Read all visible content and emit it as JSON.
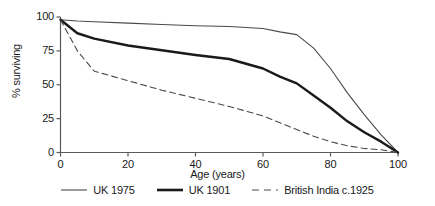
{
  "chart_data": {
    "type": "line",
    "title": "",
    "xlabel": "Age (years)",
    "ylabel": "% surviving",
    "xlim": [
      0,
      100
    ],
    "ylim": [
      0,
      100
    ],
    "xticks": [
      0,
      20,
      40,
      60,
      80,
      100
    ],
    "yticks": [
      0,
      25,
      50,
      75,
      100
    ],
    "xtick_labels": [
      "0",
      "20",
      "40",
      "60",
      "80",
      "100"
    ],
    "ytick_labels": [
      "0",
      "25",
      "50",
      "75",
      "100"
    ],
    "grid": false,
    "legend_position": "below",
    "series": [
      {
        "name": "UK 1975",
        "style": "thin-solid",
        "color": "#4a4a4a",
        "width": 1.1,
        "x": [
          0,
          5,
          10,
          20,
          30,
          40,
          50,
          60,
          65,
          70,
          75,
          80,
          85,
          90,
          95,
          100
        ],
        "values": [
          98,
          97,
          96.5,
          95.5,
          94.5,
          93.5,
          93,
          91.5,
          89,
          87,
          77,
          62,
          44,
          28,
          13,
          0
        ]
      },
      {
        "name": "UK 1901",
        "style": "thick-solid",
        "color": "#1a1a1a",
        "width": 2.4,
        "x": [
          0,
          5,
          10,
          20,
          30,
          40,
          50,
          60,
          65,
          70,
          75,
          80,
          85,
          90,
          95,
          100
        ],
        "values": [
          98,
          88,
          84,
          79,
          75.5,
          72,
          69,
          62,
          56,
          51,
          42,
          33,
          23,
          15,
          8,
          0
        ]
      },
      {
        "name": "British India c.1925",
        "style": "dashed",
        "color": "#4a4a4a",
        "width": 1.1,
        "x": [
          0,
          5,
          10,
          20,
          30,
          40,
          50,
          60,
          65,
          70,
          75,
          80,
          85,
          90,
          95,
          100
        ],
        "values": [
          98,
          75,
          60,
          53,
          46,
          40,
          34,
          27,
          22,
          17,
          12,
          8,
          5,
          3,
          2,
          0
        ]
      }
    ]
  },
  "axes": {
    "x_title": "Age (years)",
    "y_title": "% surviving"
  },
  "legend": {
    "items": [
      {
        "label": "UK 1975",
        "style": "thin-solid"
      },
      {
        "label": "UK 1901",
        "style": "thick-solid"
      },
      {
        "label": "British India c.1925",
        "style": "dashed"
      }
    ]
  },
  "colors": {
    "axis": "#5a5a5a",
    "text": "#1a1a1a",
    "thin_line": "#4a4a4a",
    "thick_line": "#1a1a1a",
    "dashed_line": "#4a4a4a",
    "background": "#ffffff"
  }
}
